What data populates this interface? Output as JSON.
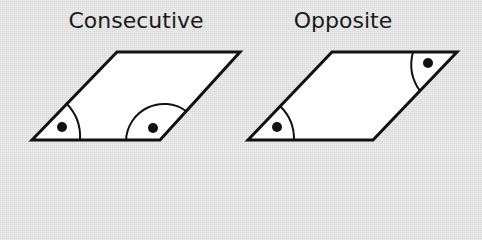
{
  "diagram": {
    "panels": [
      {
        "title": "Consecutive",
        "shape": "parallelogram",
        "vertices": [
          [
            32,
            140
          ],
          [
            160,
            140
          ],
          [
            240,
            52
          ],
          [
            117,
            52
          ]
        ],
        "marked_angles": [
          "bottom-left",
          "bottom-right"
        ]
      },
      {
        "title": "Opposite",
        "shape": "parallelogram",
        "vertices": [
          [
            248,
            140
          ],
          [
            373,
            140
          ],
          [
            457,
            52
          ],
          [
            332,
            52
          ]
        ],
        "marked_angles": [
          "bottom-left",
          "top-right"
        ]
      }
    ],
    "colors": {
      "background": "#e4e4e4",
      "fill": "#ffffff",
      "stroke": "#111111",
      "text": "#1a1a1a"
    }
  }
}
